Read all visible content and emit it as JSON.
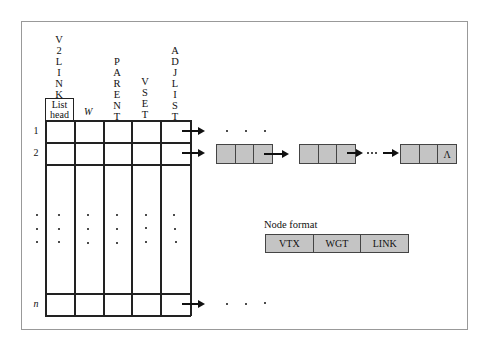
{
  "diagram": {
    "column_headers": [
      {
        "label": "V2LINK",
        "letters": [
          "V",
          "2",
          "L",
          "I",
          "N",
          "K"
        ]
      },
      {
        "label": "PARENT",
        "letters": [
          "P",
          "A",
          "R",
          "E",
          "N",
          "T"
        ]
      },
      {
        "label": "VSET",
        "letters": [
          "V",
          "S",
          "E",
          "T"
        ]
      },
      {
        "label": "ADJLIST",
        "letters": [
          "A",
          "D",
          "J",
          "L",
          "I",
          "S",
          "T"
        ]
      }
    ],
    "list_head_line1": "List",
    "list_head_line2": "head",
    "w_label": "W",
    "row_labels": [
      "1",
      "2",
      "n"
    ],
    "null_symbol": "Λ",
    "node_format": {
      "title": "Node format",
      "fields": [
        "VTX",
        "WGT",
        "LINK"
      ]
    }
  }
}
